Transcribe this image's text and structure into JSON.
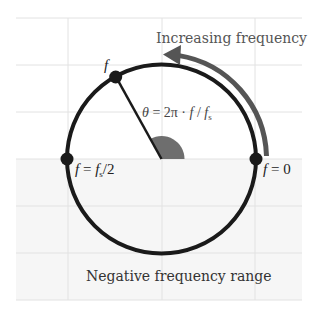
{
  "diagram": {
    "labels": {
      "increasing": "Increasing frequency",
      "negative_range": "Negative frequency range",
      "point_f": "f",
      "theta_formula_theta": "θ",
      "theta_formula_eq": " = 2π · ",
      "theta_formula_f": "f",
      "theta_formula_slash": " / ",
      "theta_formula_fs": "f",
      "theta_formula_fs_sub": "s",
      "half_f": "f",
      "half_eq": " = ",
      "half_fs": "f",
      "half_fs_sub": "s",
      "half_div": "/2",
      "zero_f": "f",
      "zero_eq": " = 0"
    },
    "colors": {
      "circle": "#1a1a1a",
      "arrow": "#555555",
      "wedge": "#6e6e6e",
      "grid": "#e2e2e2",
      "negative_fill": "#f6f6f6",
      "text_gray": "#555555",
      "text_dark": "#333333"
    },
    "geometry": {
      "center": [
        161.5,
        159
      ],
      "radius": 94.5,
      "point_f_angle_deg": 119,
      "arrow_radius": 105,
      "arrow_end_angle_deg": 88
    }
  }
}
